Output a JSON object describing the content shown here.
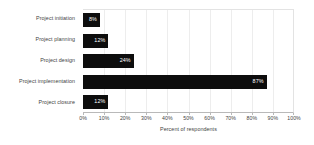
{
  "chart_data": {
    "type": "bar",
    "orientation": "horizontal",
    "title": "",
    "subtitle": "",
    "categories": [
      "Project initiation",
      "Project planning",
      "Project design",
      "Project implementation",
      "Project closure"
    ],
    "values": [
      8,
      12,
      24,
      87,
      12
    ],
    "data_labels": [
      "8%",
      "12%",
      "24%",
      "87%",
      "12%"
    ],
    "xlabel": "Percent of respondents",
    "ylabel": "",
    "xlim": [
      0,
      100
    ],
    "xticks": [
      0,
      10,
      20,
      30,
      40,
      50,
      60,
      70,
      80,
      90,
      100
    ],
    "xticklabels": [
      "0%",
      "10%",
      "20%",
      "30%",
      "40%",
      "50%",
      "60%",
      "70%",
      "80%",
      "90%",
      "100%"
    ],
    "grid": "vertical",
    "legend": "none",
    "bar_color": "#0d0d0d",
    "data_label_color": "#ffffff",
    "gridline_color": "#ededed",
    "axis_color": "#b9b9b9",
    "background_color": "#ffffff"
  }
}
